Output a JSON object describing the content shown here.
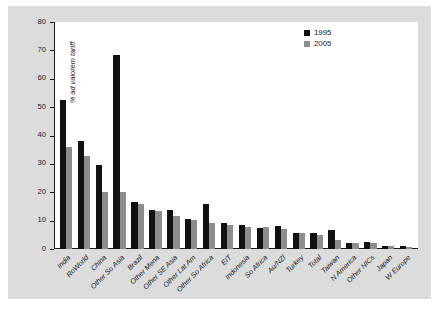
{
  "chart_data": {
    "type": "bar",
    "title": "",
    "xlabel": "",
    "ylabel": "% ad valorem tariff",
    "ylim": [
      0,
      80
    ],
    "yticks": [
      0,
      10,
      20,
      30,
      40,
      50,
      60,
      70,
      80
    ],
    "grid": false,
    "legend_position": "top-right",
    "categories": [
      "India",
      "RoWorld",
      "China",
      "Other So Asia",
      "Brazil",
      "Other Mena",
      "Other SE Asia",
      "Other Lat Am",
      "Other So Africa",
      "EIT",
      "Indonesia",
      "So Africa",
      "Au/NZl",
      "Turkey",
      "Total",
      "Taiwan",
      "N America",
      "Other NICs",
      "Japan",
      "W Europe"
    ],
    "series": [
      {
        "name": "1995",
        "color": "#111111",
        "values": [
          52.5,
          38.0,
          29.5,
          68.5,
          16.5,
          13.8,
          13.6,
          10.6,
          16.0,
          9.0,
          8.4,
          7.4,
          8.2,
          5.8,
          5.5,
          6.8,
          2.0,
          2.5,
          1.2,
          0.9
        ]
      },
      {
        "name": "2005",
        "color": "#8d8d8d",
        "values": [
          35.8,
          32.8,
          20.2,
          20.1,
          15.7,
          13.4,
          11.5,
          10.2,
          9.0,
          8.4,
          7.6,
          7.6,
          7.0,
          5.6,
          4.9,
          3.2,
          2.0,
          2.1,
          1.1,
          0.8
        ]
      }
    ]
  },
  "legend": {
    "items": [
      {
        "label": "1995",
        "swatch": "legend-swatch-1995"
      },
      {
        "label": "2005",
        "swatch": "legend-swatch-2005"
      }
    ]
  },
  "axes": {
    "y_label": "% ad valorem tariff",
    "y_tick_labels": [
      "80",
      "70",
      "60",
      "50",
      "40",
      "30",
      "20",
      "10",
      "0"
    ]
  },
  "caption": {
    "text": ""
  }
}
